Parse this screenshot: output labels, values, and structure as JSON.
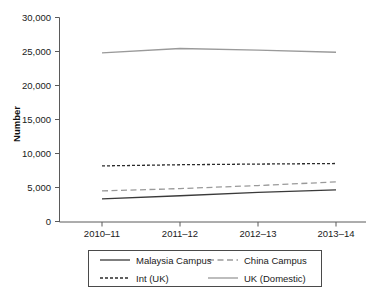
{
  "chart_data": {
    "type": "line",
    "title": "",
    "xlabel": "",
    "ylabel": "Number",
    "categories": [
      "2010–11",
      "2011–12",
      "2012–13",
      "2013–14"
    ],
    "ylim": [
      0,
      30000
    ],
    "ytick_values": [
      0,
      5000,
      10000,
      15000,
      20000,
      25000,
      30000
    ],
    "ytick_labels": [
      "0",
      "5,000",
      "10,000",
      "15,000",
      "20,000",
      "25,000",
      "30,000"
    ],
    "grid": false,
    "legend_position": "bottom",
    "series": [
      {
        "name": "Malaysia Campus",
        "values": [
          3380,
          3850,
          4350,
          4700
        ],
        "color": "#3a3a3a",
        "style": "solid",
        "width": 1.3
      },
      {
        "name": "China Campus",
        "values": [
          4560,
          4900,
          5350,
          5880
        ],
        "color": "#9a9a9a",
        "style": "dashed",
        "width": 1.3
      },
      {
        "name": "Int (UK)",
        "values": [
          8230,
          8400,
          8500,
          8580
        ],
        "color": "#2b2b2b",
        "style": "dotted-dash",
        "width": 1.3
      },
      {
        "name": "UK (Domestic)",
        "values": [
          24800,
          25450,
          25200,
          24900
        ],
        "color": "#9a9a9a",
        "style": "solid",
        "width": 1.3
      }
    ]
  },
  "axes": {
    "y_axis_title": "Number",
    "y_ticks": [
      {
        "label": "30,000"
      },
      {
        "label": "25,000"
      },
      {
        "label": "20,000"
      },
      {
        "label": "15,000"
      },
      {
        "label": "10,000"
      },
      {
        "label": "5,000"
      },
      {
        "label": "0"
      }
    ],
    "x_ticks": [
      {
        "label": "2010–11"
      },
      {
        "label": "2011–12"
      },
      {
        "label": "2012–13"
      },
      {
        "label": "2013–14"
      }
    ]
  },
  "legend": {
    "entries": [
      {
        "label": "Malaysia Campus"
      },
      {
        "label": "China Campus"
      },
      {
        "label": "Int (UK)"
      },
      {
        "label": "UK (Domestic)"
      }
    ]
  }
}
